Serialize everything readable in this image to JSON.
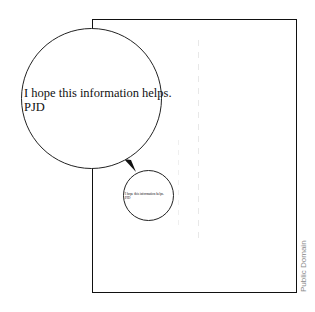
{
  "page": {
    "border_color": "#111111"
  },
  "big_bubble": {
    "line1": "I hope this information helps.",
    "line2": "PJD"
  },
  "small_bubble": {
    "line1": "I hope this information helps.",
    "line2": "PJD"
  },
  "credit": "Public Domain"
}
